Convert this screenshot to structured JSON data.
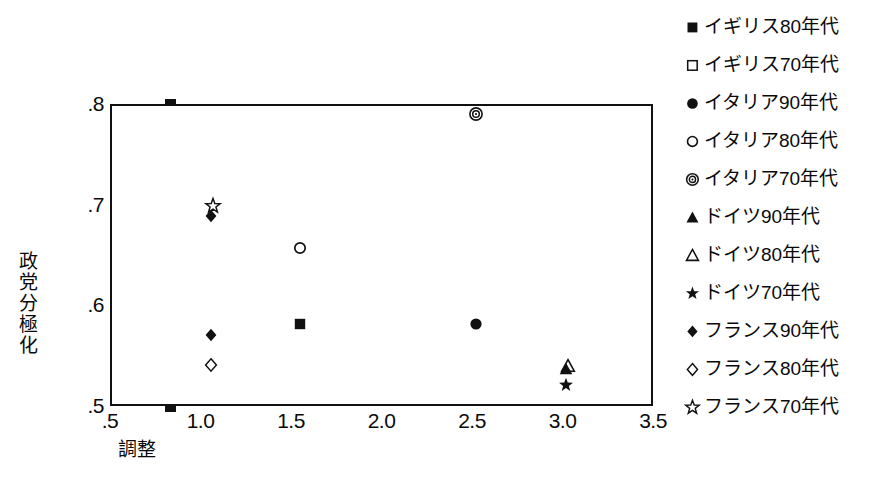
{
  "chart_data": {
    "type": "scatter",
    "title": "",
    "subtitle": "",
    "xlabel": "調整",
    "ylabel": "政党分極化",
    "xlim": [
      0.5,
      3.5
    ],
    "ylim": [
      0.5,
      0.8
    ],
    "grid": false,
    "legend_position": "right",
    "xticks": [
      ".5",
      "1.0",
      "1.5",
      "2.0",
      "2.5",
      "3.0",
      "3.5"
    ],
    "xtick_values": [
      0.5,
      1.0,
      1.5,
      2.0,
      2.5,
      3.0,
      3.5
    ],
    "yticks": [
      ".5",
      ".6",
      ".7",
      ".8"
    ],
    "ytick_values": [
      0.5,
      0.6,
      0.7,
      0.8
    ],
    "series": [
      {
        "name": "イギリス80年代",
        "marker": "filled-square",
        "points": [
          {
            "x": 1.55,
            "y": 0.581
          }
        ]
      },
      {
        "name": "イギリス70年代",
        "marker": "open-square",
        "points": []
      },
      {
        "name": "イタリア90年代",
        "marker": "filled-circle",
        "points": [
          {
            "x": 2.52,
            "y": 0.581
          }
        ]
      },
      {
        "name": "イタリア80年代",
        "marker": "open-circle",
        "points": [
          {
            "x": 1.55,
            "y": 0.657
          }
        ]
      },
      {
        "name": "イタリア70年代",
        "marker": "bullseye-circle",
        "points": [
          {
            "x": 2.52,
            "y": 0.79
          }
        ]
      },
      {
        "name": "ドイツ90年代",
        "marker": "filled-triangle",
        "points": [
          {
            "x": 3.02,
            "y": 0.537
          }
        ]
      },
      {
        "name": "ドイツ80年代",
        "marker": "open-triangle",
        "points": [
          {
            "x": 3.03,
            "y": 0.54
          }
        ]
      },
      {
        "name": "ドイツ70年代",
        "marker": "filled-star",
        "points": [
          {
            "x": 3.02,
            "y": 0.521
          }
        ]
      },
      {
        "name": "フランス90年代",
        "marker": "filled-diamond",
        "points": [
          {
            "x": 1.06,
            "y": 0.689
          },
          {
            "x": 1.06,
            "y": 0.571
          }
        ]
      },
      {
        "name": "フランス80年代",
        "marker": "open-diamond",
        "points": [
          {
            "x": 1.06,
            "y": 0.541
          }
        ]
      },
      {
        "name": "フランス70年代",
        "marker": "open-star",
        "points": [
          {
            "x": 1.07,
            "y": 0.699
          }
        ]
      }
    ],
    "colors": {
      "marker": "#111111",
      "axis": "#111111",
      "background": "#ffffff",
      "text": "#0a0a0a"
    }
  },
  "legend": {
    "items": [
      {
        "label": "イギリス80年代",
        "marker": "filled-square"
      },
      {
        "label": "イギリス70年代",
        "marker": "open-square"
      },
      {
        "label": "イタリア90年代",
        "marker": "filled-circle"
      },
      {
        "label": "イタリア80年代",
        "marker": "open-circle"
      },
      {
        "label": "イタリア70年代",
        "marker": "bullseye-circle"
      },
      {
        "label": "ドイツ90年代",
        "marker": "filled-triangle"
      },
      {
        "label": "ドイツ80年代",
        "marker": "open-triangle"
      },
      {
        "label": "ドイツ70年代",
        "marker": "filled-star"
      },
      {
        "label": "フランス90年代",
        "marker": "filled-diamond"
      },
      {
        "label": "フランス80年代",
        "marker": "open-diamond"
      },
      {
        "label": "フランス70年代",
        "marker": "open-star"
      }
    ]
  }
}
